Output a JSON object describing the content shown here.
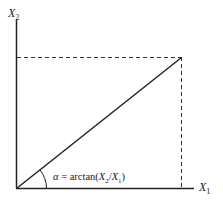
{
  "diagram": {
    "type": "vector-angle",
    "y_axis_label": {
      "base": "X",
      "sub": "2"
    },
    "x_axis_label": {
      "base": "X",
      "sub": "1"
    },
    "angle_label": {
      "symbol": "α",
      "equals": " = arctan(",
      "num_base": "X",
      "num_sub": "2",
      "slash": "/",
      "den_base": "X",
      "den_sub": "1",
      "close": ")"
    },
    "colors": {
      "line": "#222222",
      "background": "#ffffff"
    }
  }
}
